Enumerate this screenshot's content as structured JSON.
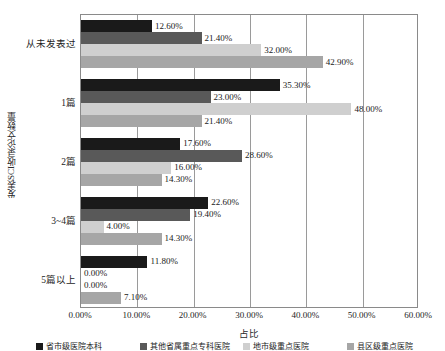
{
  "chart_data": {
    "type": "bar",
    "orientation": "horizontal",
    "title": "",
    "xlabel": "占比",
    "ylabel": "发表SCI收录论文数量",
    "xlim": [
      0,
      0.6
    ],
    "grid": true,
    "legend_position": "bottom",
    "xtick_labels": [
      "0.00%",
      "10.00%",
      "20.00%",
      "30.00%",
      "40.00%",
      "50.00%",
      "60.00%"
    ],
    "xtick_values": [
      0,
      10,
      20,
      30,
      40,
      50,
      60
    ],
    "categories": [
      "从未发表过",
      "1篇",
      "2篇",
      "3~4篇",
      "5篇以上"
    ],
    "series": [
      {
        "name": "省市级医院本科",
        "color": "#1a1a1a",
        "values": [
          12.6,
          35.3,
          17.6,
          22.6,
          11.8
        ],
        "labels": [
          "12.60%",
          "35.30%",
          "17.60%",
          "22.60%",
          "11.80%"
        ]
      },
      {
        "name": "其他省属重点专科医院",
        "color": "#595959",
        "values": [
          21.4,
          23.0,
          28.6,
          19.4,
          0.0
        ],
        "labels": [
          "21.40%",
          "23.00%",
          "28.60%",
          "19.40%",
          "0.00%"
        ]
      },
      {
        "name": "地市级重点医院",
        "color": "#cfcfcf",
        "values": [
          32.0,
          48.0,
          16.0,
          4.0,
          0.0
        ],
        "labels": [
          "32.00%",
          "48.00%",
          "16.00%",
          "4.00%",
          "0.00%"
        ]
      },
      {
        "name": "县区级重点医院",
        "color": "#a6a6a6",
        "values": [
          42.9,
          21.4,
          14.3,
          14.3,
          7.1
        ],
        "labels": [
          "42.90%",
          "21.40%",
          "14.30%",
          "14.30%",
          "7.10%"
        ]
      }
    ]
  }
}
